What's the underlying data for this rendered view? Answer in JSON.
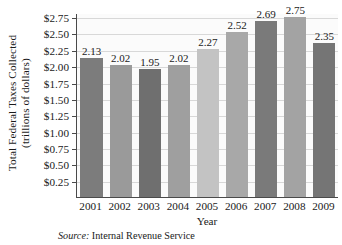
{
  "chart_data": {
    "type": "bar",
    "title": "",
    "xlabel": "Year",
    "ylabel_lines": [
      "Total Federal Taxes Collected",
      "(trillions of dollars)"
    ],
    "categories": [
      "2001",
      "2002",
      "2003",
      "2004",
      "2005",
      "2006",
      "2007",
      "2008",
      "2009"
    ],
    "values": [
      2.13,
      2.02,
      1.95,
      2.02,
      2.27,
      2.52,
      2.69,
      2.75,
      2.35
    ],
    "value_labels": [
      "2.13",
      "2.02",
      "1.95",
      "2.02",
      "2.27",
      "2.52",
      "2.69",
      "2.75",
      "2.35"
    ],
    "bar_colors": [
      "#7c7c7c",
      "#9a9a9a",
      "#6f6f6f",
      "#9f9f9f",
      "#c3c3c3",
      "#a8a8a8",
      "#7a7a7a",
      "#a3a3a3",
      "#757575"
    ],
    "ylim": [
      0,
      2.8125
    ],
    "ytick_values": [
      0.25,
      0.5,
      0.75,
      1.0,
      1.25,
      1.5,
      1.75,
      2.0,
      2.25,
      2.5,
      2.75
    ],
    "ytick_labels": [
      "$0.25",
      "$0.50",
      "$0.75",
      "$1.00",
      "$1.25",
      "$1.50",
      "$1.75",
      "$2.00",
      "$2.25",
      "$2.50",
      "$2.75"
    ],
    "grid": true,
    "grid_color": "#d8d8d8",
    "legend": "none",
    "axis_color": "#4a4a4a",
    "plot_background": "#fbfbfb"
  },
  "source": {
    "label": "Source:",
    "text": " Internal Revenue Service"
  }
}
